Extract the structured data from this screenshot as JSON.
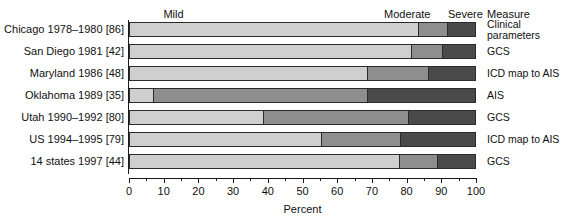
{
  "chart_data": {
    "type": "bar",
    "subtype": "stacked-horizontal-100-percent",
    "title": "",
    "xlabel": "Percent",
    "ylabel": "",
    "xlim": [
      0,
      100
    ],
    "grid": false,
    "legend_position": "column-headers-top",
    "categories": [
      "Chicago 1978–1980 [86]",
      "San Diego 1981 [42]",
      "Maryland 1986 [48]",
      "Oklahoma 1989 [35]",
      "Utah 1990–1992 [80]",
      "US 1994–1995 [79]",
      "14 states 1997 [44]"
    ],
    "series": [
      {
        "name": "Mild",
        "values": [
          83.6,
          81.6,
          68.9,
          7.2,
          38.9,
          55.6,
          78.1
        ]
      },
      {
        "name": "Moderate",
        "values": [
          8.3,
          8.9,
          17.6,
          61.7,
          41.8,
          22.8,
          11.0
        ]
      },
      {
        "name": "Severe",
        "values": [
          8.1,
          9.5,
          13.5,
          31.1,
          19.3,
          21.6,
          10.9
        ]
      }
    ],
    "column_headers": [
      "Mild",
      "Moderate",
      "Severe"
    ],
    "right_column_header": "Measure",
    "right_column_values": [
      "Clinical\nparameters",
      "GCS",
      "ICD map to AIS",
      "AIS",
      "GCS",
      "ICD map to AIS",
      "GCS"
    ],
    "x_ticks_major": [
      0,
      10,
      20,
      30,
      40,
      50,
      60,
      70,
      80,
      90,
      100
    ],
    "x_tick_labels": [
      "0",
      "10",
      "20",
      "30",
      "40",
      "50",
      "60",
      "70",
      "80",
      "90",
      "100"
    ],
    "x_ticks_minor": [
      5,
      15,
      25,
      35,
      45,
      55,
      65,
      75,
      85,
      95
    ],
    "colors": {
      "mild": "#cfcfcf",
      "moderate": "#8e8e8e",
      "severe": "#4a4a4a",
      "outline": "#2b2b2b",
      "axis": "#1a1a1a",
      "text": "#101010",
      "background": "#ffffff"
    }
  }
}
